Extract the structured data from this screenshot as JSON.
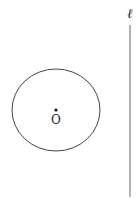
{
  "diagram": {
    "circle": {
      "center_label": "O",
      "cx": 56,
      "cy": 110,
      "rx": 44,
      "ry": 41,
      "stroke": "#444444"
    },
    "line": {
      "label": "ℓ",
      "x": 130,
      "y1": 25,
      "y2": 197,
      "stroke": "#666666"
    }
  }
}
